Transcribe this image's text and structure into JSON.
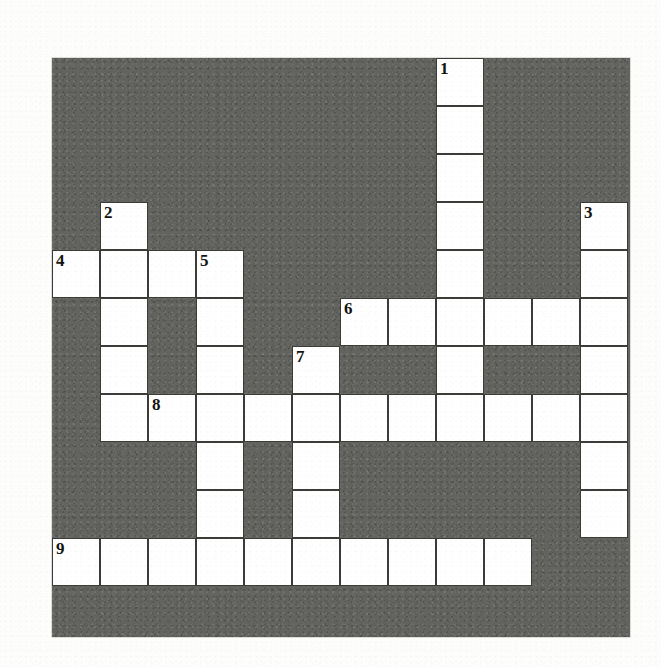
{
  "puzzle": {
    "type": "crossword-grid",
    "title": "Crossword puzzle grid",
    "columns": 12,
    "rows": 12,
    "cell_size": 48,
    "origin_x": 52,
    "origin_y": 58,
    "colors": {
      "block": "#63635f",
      "cell_fill": "#ffffff",
      "cell_border": "#3b3b38",
      "number_text": "#14140f",
      "page_background": "#fdfdfc"
    },
    "numbers": [
      {
        "label": "1",
        "row": 0,
        "col": 8
      },
      {
        "label": "2",
        "row": 3,
        "col": 1
      },
      {
        "label": "3",
        "row": 3,
        "col": 11
      },
      {
        "label": "4",
        "row": 4,
        "col": 0
      },
      {
        "label": "5",
        "row": 4,
        "col": 3
      },
      {
        "label": "6",
        "row": 5,
        "col": 6
      },
      {
        "label": "7",
        "row": 6,
        "col": 5
      },
      {
        "label": "8",
        "row": 7,
        "col": 2
      },
      {
        "label": "9",
        "row": 10,
        "col": 0
      }
    ],
    "entries": [
      {
        "number": "1",
        "direction": "down",
        "row": 0,
        "col": 8,
        "length": 7
      },
      {
        "number": "2",
        "direction": "down",
        "row": 3,
        "col": 1,
        "length": 5
      },
      {
        "number": "3",
        "direction": "down",
        "row": 3,
        "col": 11,
        "length": 6
      },
      {
        "number": "4",
        "direction": "across",
        "row": 4,
        "col": 0,
        "length": 4
      },
      {
        "number": "5",
        "direction": "down",
        "row": 4,
        "col": 3,
        "length": 6
      },
      {
        "number": "6",
        "direction": "across",
        "row": 5,
        "col": 6,
        "length": 6
      },
      {
        "number": "7",
        "direction": "down",
        "row": 6,
        "col": 5,
        "length": 4
      },
      {
        "number": "8",
        "direction": "across",
        "row": 7,
        "col": 2,
        "length": 10
      },
      {
        "number": "9",
        "direction": "across",
        "row": 10,
        "col": 0,
        "length": 10
      }
    ],
    "white_cells": [
      {
        "row": 0,
        "cols": [
          8
        ]
      },
      {
        "row": 1,
        "cols": [
          8
        ]
      },
      {
        "row": 2,
        "cols": [
          8
        ]
      },
      {
        "row": 3,
        "cols": [
          1,
          8,
          11
        ]
      },
      {
        "row": 4,
        "cols": [
          0,
          1,
          2,
          3,
          8,
          11
        ]
      },
      {
        "row": 5,
        "cols": [
          1,
          3,
          6,
          7,
          8,
          9,
          10,
          11
        ]
      },
      {
        "row": 6,
        "cols": [
          1,
          3,
          5,
          8,
          11
        ]
      },
      {
        "row": 7,
        "cols": [
          1,
          3,
          5,
          2,
          4,
          6,
          7,
          8,
          9,
          10,
          11
        ]
      },
      {
        "row": 8,
        "cols": [
          3,
          5,
          11
        ]
      },
      {
        "row": 9,
        "cols": [
          3,
          5,
          11
        ]
      },
      {
        "row": 10,
        "cols": [
          0,
          1,
          2,
          3,
          4,
          5,
          6,
          7,
          8,
          9
        ]
      },
      {
        "row": 11,
        "cols": []
      }
    ]
  }
}
